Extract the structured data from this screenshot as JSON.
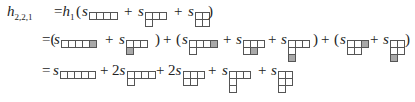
{
  "formula": {
    "lhs": {
      "symbol": "h",
      "subscript": "2,2,1"
    },
    "lines": [
      {
        "terms": [
          {
            "text": "=h",
            "sub": "1",
            "x": 54
          },
          {
            "text": "(",
            "x": 76
          },
          {
            "text": "s",
            "x": 82,
            "diagram": {
              "rows": [
                4
              ],
              "shaded": []
            }
          },
          {
            "text": "+",
            "x": 124
          },
          {
            "text": "s",
            "x": 138,
            "diagram": {
              "rows": [
                3,
                1
              ],
              "shaded": []
            }
          },
          {
            "text": "+",
            "x": 174
          },
          {
            "text": "s",
            "x": 188,
            "diagram": {
              "rows": [
                2,
                2
              ],
              "shaded": []
            }
          },
          {
            "text": ")",
            "x": 208
          }
        ]
      },
      {
        "terms": [
          {
            "text": "=(",
            "x": 42
          },
          {
            "text": "s",
            "x": 54,
            "diagram": {
              "rows": [
                5
              ],
              "shaded": [
                [
                  0,
                  4
                ]
              ]
            }
          },
          {
            "text": "+",
            "x": 105
          },
          {
            "text": "s",
            "x": 119,
            "diagram": {
              "rows": [
                3,
                1
              ],
              "shaded": [
                [
                  1,
                  0
                ]
              ]
            }
          },
          {
            "text": ")",
            "x": 155
          },
          {
            "text": "+",
            "x": 163
          },
          {
            "text": "(",
            "x": 176
          },
          {
            "text": "s",
            "x": 182,
            "diagram": {
              "rows": [
                4,
                1
              ],
              "shaded": [
                [
                  0,
                  3
                ]
              ]
            }
          },
          {
            "text": "+",
            "x": 223
          },
          {
            "text": "s",
            "x": 236,
            "diagram": {
              "rows": [
                3,
                2
              ],
              "shaded": [
                [
                  1,
                  1
                ]
              ]
            }
          },
          {
            "text": "+",
            "x": 268
          },
          {
            "text": "s",
            "x": 281,
            "diagram": {
              "rows": [
                3,
                1,
                1
              ],
              "shaded": [
                [
                  2,
                  0
                ]
              ]
            }
          },
          {
            "text": ")",
            "x": 313
          },
          {
            "text": "+",
            "x": 321
          },
          {
            "text": "(",
            "x": 334
          },
          {
            "text": "s",
            "x": 340,
            "diagram": {
              "rows": [
                3,
                2
              ],
              "shaded": [
                [
                  0,
                  2
                ]
              ]
            }
          },
          {
            "text": "+",
            "x": 370
          },
          {
            "text": "s",
            "x": 383,
            "diagram": {
              "rows": [
                2,
                2,
                1
              ],
              "shaded": [
                [
                  2,
                  0
                ]
              ]
            }
          },
          {
            "text": ")",
            "x": 405
          }
        ]
      },
      {
        "terms": [
          {
            "text": "=",
            "x": 42
          },
          {
            "text": "s",
            "x": 53,
            "diagram": {
              "rows": [
                5
              ],
              "shaded": []
            }
          },
          {
            "text": "+",
            "x": 100
          },
          {
            "text": "2s",
            "x": 112,
            "diagram": {
              "rows": [
                4,
                1
              ],
              "shaded": []
            }
          },
          {
            "text": "+",
            "x": 156
          },
          {
            "text": "2s",
            "x": 168,
            "diagram": {
              "rows": [
                3,
                2
              ],
              "shaded": []
            }
          },
          {
            "text": "+",
            "x": 208
          },
          {
            "text": "s",
            "x": 222,
            "diagram": {
              "rows": [
                3,
                1,
                1
              ],
              "shaded": []
            }
          },
          {
            "text": "+",
            "x": 258
          },
          {
            "text": "s",
            "x": 271,
            "diagram": {
              "rows": [
                2,
                2,
                1
              ],
              "shaded": []
            }
          }
        ]
      }
    ],
    "shade_color": "#a9a9a9"
  }
}
